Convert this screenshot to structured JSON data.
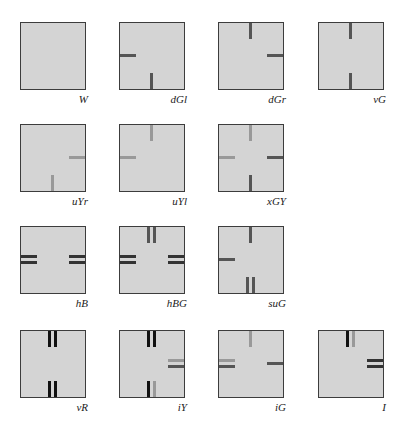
{
  "tiles": [
    {
      "label": "W",
      "x": 20,
      "y": 22,
      "bars": []
    },
    {
      "label": "dGl",
      "x": 119,
      "y": 22,
      "bars": [
        {
          "side": "left",
          "pos": 0.5,
          "color": "#555555"
        },
        {
          "side": "bottom",
          "pos": 0.5,
          "color": "#555555"
        }
      ]
    },
    {
      "label": "dGr",
      "x": 218,
      "y": 22,
      "bars": [
        {
          "side": "top",
          "pos": 0.5,
          "color": "#555555"
        },
        {
          "side": "right",
          "pos": 0.5,
          "color": "#555555"
        }
      ]
    },
    {
      "label": "vG",
      "x": 318,
      "y": 22,
      "bars": [
        {
          "side": "top",
          "pos": 0.5,
          "color": "#555555"
        },
        {
          "side": "bottom",
          "pos": 0.5,
          "color": "#555555"
        }
      ]
    },
    {
      "label": "uYr",
      "x": 20,
      "y": 124,
      "bars": [
        {
          "side": "right",
          "pos": 0.5,
          "color": "#999999"
        },
        {
          "side": "bottom",
          "pos": 0.5,
          "color": "#999999"
        }
      ]
    },
    {
      "label": "uYl",
      "x": 119,
      "y": 124,
      "bars": [
        {
          "side": "top",
          "pos": 0.5,
          "color": "#999999"
        },
        {
          "side": "left",
          "pos": 0.5,
          "color": "#999999"
        }
      ]
    },
    {
      "label": "xGY",
      "x": 218,
      "y": 124,
      "bars": [
        {
          "side": "top",
          "pos": 0.5,
          "color": "#999999"
        },
        {
          "side": "left",
          "pos": 0.5,
          "color": "#999999"
        },
        {
          "side": "right",
          "pos": 0.5,
          "color": "#555555"
        },
        {
          "side": "bottom",
          "pos": 0.5,
          "color": "#555555"
        }
      ]
    },
    {
      "label": "hB",
      "x": 20,
      "y": 226,
      "bars": [
        {
          "side": "left",
          "pos": 0.45,
          "color": "#333333"
        },
        {
          "side": "left",
          "pos": 0.55,
          "color": "#333333"
        },
        {
          "side": "right",
          "pos": 0.45,
          "color": "#333333"
        },
        {
          "side": "right",
          "pos": 0.55,
          "color": "#333333"
        }
      ]
    },
    {
      "label": "hBG",
      "x": 119,
      "y": 226,
      "bars": [
        {
          "side": "top",
          "pos": 0.45,
          "color": "#555555"
        },
        {
          "side": "top",
          "pos": 0.55,
          "color": "#555555"
        },
        {
          "side": "left",
          "pos": 0.45,
          "color": "#333333"
        },
        {
          "side": "left",
          "pos": 0.55,
          "color": "#333333"
        },
        {
          "side": "right",
          "pos": 0.45,
          "color": "#333333"
        },
        {
          "side": "right",
          "pos": 0.55,
          "color": "#333333"
        }
      ]
    },
    {
      "label": "suG",
      "x": 218,
      "y": 226,
      "bars": [
        {
          "side": "top",
          "pos": 0.5,
          "color": "#555555"
        },
        {
          "side": "left",
          "pos": 0.5,
          "color": "#555555"
        },
        {
          "side": "bottom",
          "pos": 0.45,
          "color": "#555555"
        },
        {
          "side": "bottom",
          "pos": 0.55,
          "color": "#555555"
        }
      ]
    },
    {
      "label": "vR",
      "x": 20,
      "y": 330,
      "bars": [
        {
          "side": "top",
          "pos": 0.45,
          "color": "#111111"
        },
        {
          "side": "top",
          "pos": 0.55,
          "color": "#111111"
        },
        {
          "side": "bottom",
          "pos": 0.45,
          "color": "#111111"
        },
        {
          "side": "bottom",
          "pos": 0.55,
          "color": "#111111"
        }
      ]
    },
    {
      "label": "iY",
      "x": 119,
      "y": 330,
      "bars": [
        {
          "side": "top",
          "pos": 0.45,
          "color": "#111111"
        },
        {
          "side": "top",
          "pos": 0.55,
          "color": "#111111"
        },
        {
          "side": "right",
          "pos": 0.45,
          "color": "#999999"
        },
        {
          "side": "right",
          "pos": 0.55,
          "color": "#555555"
        },
        {
          "side": "bottom",
          "pos": 0.45,
          "color": "#111111"
        },
        {
          "side": "bottom",
          "pos": 0.55,
          "color": "#999999"
        }
      ]
    },
    {
      "label": "iG",
      "x": 218,
      "y": 330,
      "bars": [
        {
          "side": "top",
          "pos": 0.5,
          "color": "#999999"
        },
        {
          "side": "left",
          "pos": 0.45,
          "color": "#999999"
        },
        {
          "side": "left",
          "pos": 0.55,
          "color": "#555555"
        },
        {
          "side": "right",
          "pos": 0.5,
          "color": "#555555"
        }
      ]
    },
    {
      "label": "I",
      "x": 318,
      "y": 330,
      "bars": [
        {
          "side": "top",
          "pos": 0.45,
          "color": "#111111"
        },
        {
          "side": "top",
          "pos": 0.55,
          "color": "#999999"
        },
        {
          "side": "right",
          "pos": 0.45,
          "color": "#333333"
        },
        {
          "side": "right",
          "pos": 0.55,
          "color": "#333333"
        }
      ]
    }
  ]
}
